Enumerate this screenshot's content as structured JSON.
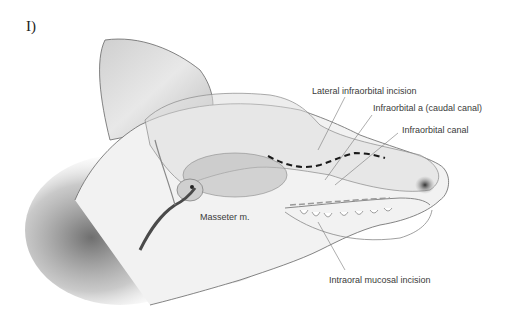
{
  "figure": {
    "panel_label": "I)",
    "labels": {
      "lateral_infraorbital_incision": "Lateral infraorbital incision",
      "infraorbital_a_caudal_canal": "Infraorbital a  (caudal canal)",
      "infraorbital_canal": "Infraorbital canal",
      "masseter": "Masseter m.",
      "intraoral_mucosal_incision": "Intraoral mucosal incision"
    },
    "colors": {
      "ink": "#3a3a3a",
      "leader": "#777777",
      "dashed_incision": "#1a1a1a",
      "shading": "#5a5a5a"
    }
  }
}
